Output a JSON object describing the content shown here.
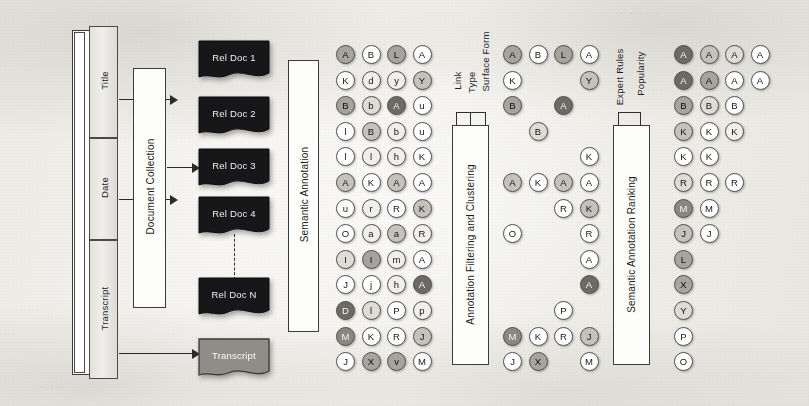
{
  "figure": {
    "background_color": "#f4f3f0",
    "ink_color": "#1d1d1d"
  },
  "source_block": {
    "container_label": "Newscast",
    "fields": [
      {
        "label": "Title"
      },
      {
        "label": "Date"
      },
      {
        "label": "Transcript"
      }
    ]
  },
  "document_collection": {
    "label": "Document Collection"
  },
  "documents": {
    "items": [
      {
        "label": "Rel Doc 1",
        "kind": "dark"
      },
      {
        "label": "Rel Doc 2",
        "kind": "dark"
      },
      {
        "label": "Rel Doc 3",
        "kind": "dark"
      },
      {
        "label": "Rel Doc 4",
        "kind": "dark"
      },
      {
        "label": "Rel Doc N",
        "kind": "dark"
      },
      {
        "label": "Transcript",
        "kind": "gray"
      }
    ],
    "ellipsis_connector": "dashed-vertical"
  },
  "stages": [
    {
      "name": "semantic-annotation",
      "label": "Semantic Annotation",
      "inputs": []
    },
    {
      "name": "annotation-filtering-and-clustering",
      "label": "Annotation Filtering and Clustering",
      "inputs": [
        "Link",
        "Type",
        "Surface Form"
      ]
    },
    {
      "name": "semantic-annotation-ranking",
      "label": "Semantic Annotation Ranking",
      "inputs": [
        "Expert Rules",
        "Popularity"
      ]
    }
  ],
  "chart_data": {
    "type": "table",
    "shade_scale": [
      "#ffffff",
      "#f0efec",
      "#dedcd7",
      "#c5c2bc",
      "#a7a49d",
      "#8a877f",
      "#6d6a63",
      "#4e4b46"
    ],
    "grids": [
      {
        "name": "annotations-raw",
        "stage": "Semantic Annotation",
        "rows": 13,
        "cols": 4,
        "cells": [
          [
            {
              "t": "A",
              "s": 4
            },
            {
              "t": "B",
              "s": 0
            },
            {
              "t": "L",
              "s": 4
            },
            {
              "t": "A",
              "s": 0
            }
          ],
          [
            {
              "t": "K",
              "s": 0
            },
            {
              "t": "d",
              "s": 1
            },
            {
              "t": "y",
              "s": 1
            },
            {
              "t": "Y",
              "s": 3
            }
          ],
          [
            {
              "t": "B",
              "s": 4
            },
            {
              "t": "b",
              "s": 2
            },
            {
              "t": "A",
              "s": 6
            },
            {
              "t": "u",
              "s": 0
            }
          ],
          [
            {
              "t": "l",
              "s": 0
            },
            {
              "t": "B",
              "s": 3
            },
            {
              "t": "b",
              "s": 1
            },
            {
              "t": "u",
              "s": 0
            }
          ],
          [
            {
              "t": "l",
              "s": 0
            },
            {
              "t": "l",
              "s": 1
            },
            {
              "t": "h",
              "s": 1
            },
            {
              "t": "K",
              "s": 0
            }
          ],
          [
            {
              "t": "A",
              "s": 3
            },
            {
              "t": "K",
              "s": 0
            },
            {
              "t": "A",
              "s": 3
            },
            {
              "t": "A",
              "s": 0
            }
          ],
          [
            {
              "t": "u",
              "s": 0
            },
            {
              "t": "r",
              "s": 1
            },
            {
              "t": "R",
              "s": 0
            },
            {
              "t": "K",
              "s": 3
            }
          ],
          [
            {
              "t": "O",
              "s": 0
            },
            {
              "t": "a",
              "s": 1
            },
            {
              "t": "a",
              "s": 3
            },
            {
              "t": "R",
              "s": 1
            }
          ],
          [
            {
              "t": "I",
              "s": 2
            },
            {
              "t": "I",
              "s": 4
            },
            {
              "t": "m",
              "s": 1
            },
            {
              "t": "A",
              "s": 0
            }
          ],
          [
            {
              "t": "J",
              "s": 0
            },
            {
              "t": "j",
              "s": 0
            },
            {
              "t": "h",
              "s": 1
            },
            {
              "t": "A",
              "s": 6
            }
          ],
          [
            {
              "t": "D",
              "s": 6
            },
            {
              "t": "l",
              "s": 2
            },
            {
              "t": "P",
              "s": 0
            },
            {
              "t": "p",
              "s": 1
            }
          ],
          [
            {
              "t": "M",
              "s": 5
            },
            {
              "t": "K",
              "s": 0
            },
            {
              "t": "R",
              "s": 0
            },
            {
              "t": "J",
              "s": 3
            }
          ],
          [
            {
              "t": "J",
              "s": 0
            },
            {
              "t": "X",
              "s": 4
            },
            {
              "t": "v",
              "s": 4
            },
            {
              "t": "M",
              "s": 0
            }
          ]
        ]
      },
      {
        "name": "annotations-filtered",
        "stage": "Annotation Filtering and Clustering",
        "rows": 13,
        "cols": 4,
        "cells": [
          [
            {
              "t": "A",
              "s": 4
            },
            {
              "t": "B",
              "s": 0
            },
            {
              "t": "L",
              "s": 4
            },
            {
              "t": "A",
              "s": 0
            }
          ],
          [
            {
              "t": "K",
              "s": 0
            },
            null,
            null,
            {
              "t": "Y",
              "s": 3
            }
          ],
          [
            {
              "t": "B",
              "s": 4
            },
            null,
            {
              "t": "A",
              "s": 6
            },
            null
          ],
          [
            null,
            {
              "t": "B",
              "s": 2
            },
            null,
            null
          ],
          [
            null,
            null,
            null,
            {
              "t": "K",
              "s": 0
            }
          ],
          [
            {
              "t": "A",
              "s": 3
            },
            {
              "t": "K",
              "s": 0
            },
            {
              "t": "A",
              "s": 3
            },
            {
              "t": "A",
              "s": 0
            }
          ],
          [
            null,
            null,
            {
              "t": "R",
              "s": 0
            },
            {
              "t": "K",
              "s": 3
            }
          ],
          [
            {
              "t": "O",
              "s": 0
            },
            null,
            null,
            {
              "t": "R",
              "s": 0
            }
          ],
          [
            null,
            null,
            null,
            {
              "t": "A",
              "s": 0
            }
          ],
          [
            null,
            null,
            null,
            {
              "t": "A",
              "s": 6
            }
          ],
          [
            null,
            null,
            {
              "t": "P",
              "s": 0
            },
            null
          ],
          [
            {
              "t": "M",
              "s": 5
            },
            {
              "t": "K",
              "s": 0
            },
            {
              "t": "R",
              "s": 0
            },
            {
              "t": "J",
              "s": 3
            }
          ],
          [
            {
              "t": "J",
              "s": 0
            },
            {
              "t": "X",
              "s": 4
            },
            null,
            {
              "t": "M",
              "s": 0
            }
          ]
        ]
      },
      {
        "name": "annotations-ranked",
        "stage": "Semantic Annotation Ranking",
        "rows": 13,
        "cols": 4,
        "cells": [
          [
            {
              "t": "A",
              "s": 6
            },
            {
              "t": "A",
              "s": 3
            },
            {
              "t": "A",
              "s": 2
            },
            {
              "t": "A",
              "s": 0
            }
          ],
          [
            {
              "t": "A",
              "s": 6
            },
            {
              "t": "A",
              "s": 4
            },
            {
              "t": "A",
              "s": 0
            },
            {
              "t": "A",
              "s": 0
            }
          ],
          [
            {
              "t": "B",
              "s": 4
            },
            {
              "t": "B",
              "s": 2
            },
            {
              "t": "B",
              "s": 0
            },
            null
          ],
          [
            {
              "t": "K",
              "s": 3
            },
            {
              "t": "K",
              "s": 0
            },
            {
              "t": "K",
              "s": 1
            },
            null
          ],
          [
            {
              "t": "K",
              "s": 0
            },
            {
              "t": "K",
              "s": 0
            },
            null,
            null
          ],
          [
            {
              "t": "R",
              "s": 2
            },
            {
              "t": "R",
              "s": 0
            },
            {
              "t": "R",
              "s": 0
            },
            null
          ],
          [
            {
              "t": "M",
              "s": 5
            },
            {
              "t": "M",
              "s": 0
            },
            null,
            null
          ],
          [
            {
              "t": "J",
              "s": 3
            },
            {
              "t": "J",
              "s": 0
            },
            null,
            null
          ],
          [
            {
              "t": "L",
              "s": 4
            },
            null,
            null,
            null
          ],
          [
            {
              "t": "X",
              "s": 4
            },
            null,
            null,
            null
          ],
          [
            {
              "t": "Y",
              "s": 2
            },
            null,
            null,
            null
          ],
          [
            {
              "t": "P",
              "s": 0
            },
            null,
            null,
            null
          ],
          [
            {
              "t": "O",
              "s": 0
            },
            null,
            null,
            null
          ]
        ]
      }
    ]
  }
}
